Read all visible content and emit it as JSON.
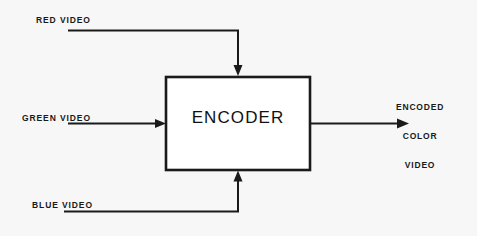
{
  "diagram": {
    "background_color": "#f7f7f7",
    "line_color": "#1a1a1a",
    "block": {
      "label": "ENCODER",
      "x": 166,
      "y": 77,
      "width": 144,
      "height": 93
    },
    "inputs": [
      {
        "id": "red",
        "label": "RED VIDEO",
        "direction": "down-into-top"
      },
      {
        "id": "green",
        "label": "GREEN VIDEO",
        "direction": "right-into-left"
      },
      {
        "id": "blue",
        "label": "BLUE VIDEO",
        "direction": "up-into-bottom"
      }
    ],
    "output": {
      "id": "encoded-color-video",
      "label_lines": [
        "ENCODED",
        "COLOR",
        "VIDEO"
      ],
      "direction": "right-out-of-right"
    }
  }
}
